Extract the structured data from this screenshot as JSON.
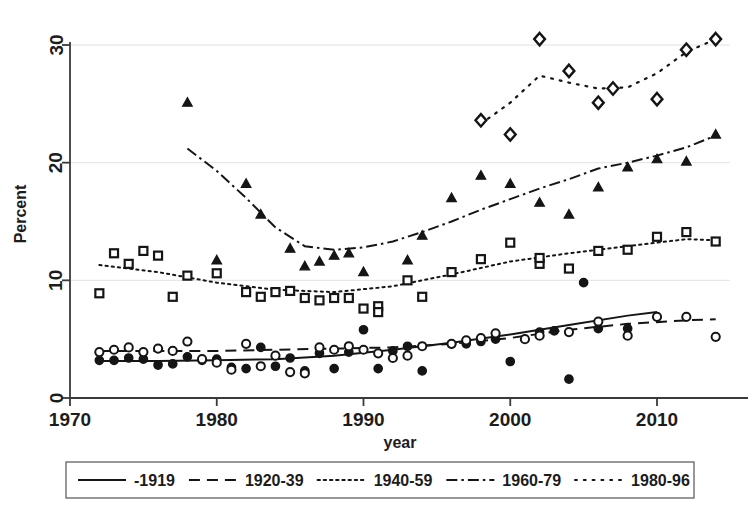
{
  "figure": {
    "width": 756,
    "height": 525,
    "background": "#ffffff",
    "ink_color": "#151515",
    "grid_color": "#e2e2e2",
    "clipped_top_caption": ""
  },
  "chart_data": {
    "type": "scatter",
    "title": "",
    "subtitle": "",
    "xlabel": "year",
    "ylabel": "Percent",
    "xlim": [
      1970,
      2015
    ],
    "ylim": [
      0,
      31.5
    ],
    "xticks": [
      1970,
      1980,
      1990,
      2000,
      2010
    ],
    "yticks": [
      0,
      10,
      20,
      30
    ],
    "xtick_labels": [
      "1970",
      "1980",
      "1990",
      "2000",
      "2010"
    ],
    "ytick_labels": [
      "0",
      "10",
      "20",
      "30"
    ],
    "grid": "horizontal",
    "legend_position": "below-axes",
    "legend_entries": [
      {
        "label": "-1919",
        "dash": "solid",
        "marker": "filled-circle"
      },
      {
        "label": "1920-39",
        "dash": "dashed",
        "marker": "open-circle"
      },
      {
        "label": "1940-59",
        "dash": "dotted",
        "marker": "open-square"
      },
      {
        "label": "1960-79",
        "dash": "dash-dot",
        "marker": "filled-triangle"
      },
      {
        "label": "1980-96",
        "dash": "sparse-dot",
        "marker": "open-diamond"
      }
    ],
    "series": [
      {
        "name": "-1919",
        "marker": "filled-circle",
        "dash": "solid",
        "points": [
          {
            "x": 1972,
            "y": 3.2
          },
          {
            "x": 1973,
            "y": 3.2
          },
          {
            "x": 1974,
            "y": 3.4
          },
          {
            "x": 1975,
            "y": 3.3
          },
          {
            "x": 1976,
            "y": 2.8
          },
          {
            "x": 1977,
            "y": 2.9
          },
          {
            "x": 1978,
            "y": 3.5
          },
          {
            "x": 1979,
            "y": 3.2
          },
          {
            "x": 1980,
            "y": 3.3
          },
          {
            "x": 1981,
            "y": 2.6
          },
          {
            "x": 1982,
            "y": 2.5
          },
          {
            "x": 1983,
            "y": 4.3
          },
          {
            "x": 1984,
            "y": 2.7
          },
          {
            "x": 1985,
            "y": 3.4
          },
          {
            "x": 1986,
            "y": 2.3
          },
          {
            "x": 1987,
            "y": 3.8
          },
          {
            "x": 1988,
            "y": 2.5
          },
          {
            "x": 1989,
            "y": 3.9
          },
          {
            "x": 1990,
            "y": 5.8
          },
          {
            "x": 1991,
            "y": 2.5
          },
          {
            "x": 1992,
            "y": 4.0
          },
          {
            "x": 1993,
            "y": 4.4
          },
          {
            "x": 1994,
            "y": 2.3
          },
          {
            "x": 1996,
            "y": 4.6
          },
          {
            "x": 1997,
            "y": 4.6
          },
          {
            "x": 1998,
            "y": 4.8
          },
          {
            "x": 1999,
            "y": 5.0
          },
          {
            "x": 2000,
            "y": 3.1
          },
          {
            "x": 2002,
            "y": 5.6
          },
          {
            "x": 2003,
            "y": 5.7
          },
          {
            "x": 2004,
            "y": 1.6
          },
          {
            "x": 2005,
            "y": 9.8
          },
          {
            "x": 2006,
            "y": 5.9
          },
          {
            "x": 2008,
            "y": 5.9
          }
        ],
        "trend": [
          {
            "x": 1972,
            "y": 3.15
          },
          {
            "x": 1976,
            "y": 3.15
          },
          {
            "x": 1980,
            "y": 3.2
          },
          {
            "x": 1984,
            "y": 3.3
          },
          {
            "x": 1988,
            "y": 3.6
          },
          {
            "x": 1992,
            "y": 4.1
          },
          {
            "x": 1996,
            "y": 4.7
          },
          {
            "x": 2000,
            "y": 5.4
          },
          {
            "x": 2004,
            "y": 6.2
          },
          {
            "x": 2008,
            "y": 7.0
          },
          {
            "x": 2010,
            "y": 7.3
          }
        ]
      },
      {
        "name": "1920-39",
        "marker": "open-circle",
        "dash": "dashed",
        "points": [
          {
            "x": 1972,
            "y": 3.9
          },
          {
            "x": 1973,
            "y": 4.1
          },
          {
            "x": 1974,
            "y": 4.3
          },
          {
            "x": 1975,
            "y": 3.9
          },
          {
            "x": 1976,
            "y": 4.2
          },
          {
            "x": 1977,
            "y": 4.0
          },
          {
            "x": 1978,
            "y": 4.8
          },
          {
            "x": 1979,
            "y": 3.3
          },
          {
            "x": 1980,
            "y": 3.0
          },
          {
            "x": 1981,
            "y": 2.4
          },
          {
            "x": 1982,
            "y": 4.6
          },
          {
            "x": 1983,
            "y": 2.7
          },
          {
            "x": 1984,
            "y": 3.6
          },
          {
            "x": 1985,
            "y": 2.2
          },
          {
            "x": 1986,
            "y": 2.1
          },
          {
            "x": 1987,
            "y": 4.3
          },
          {
            "x": 1988,
            "y": 4.1
          },
          {
            "x": 1989,
            "y": 4.4
          },
          {
            "x": 1990,
            "y": 4.1
          },
          {
            "x": 1991,
            "y": 3.8
          },
          {
            "x": 1992,
            "y": 3.4
          },
          {
            "x": 1993,
            "y": 3.6
          },
          {
            "x": 1994,
            "y": 4.4
          },
          {
            "x": 1996,
            "y": 4.6
          },
          {
            "x": 1997,
            "y": 4.9
          },
          {
            "x": 1998,
            "y": 5.1
          },
          {
            "x": 1999,
            "y": 5.5
          },
          {
            "x": 2001,
            "y": 5.0
          },
          {
            "x": 2002,
            "y": 5.3
          },
          {
            "x": 2004,
            "y": 5.6
          },
          {
            "x": 2006,
            "y": 6.5
          },
          {
            "x": 2008,
            "y": 5.3
          },
          {
            "x": 2010,
            "y": 6.9
          },
          {
            "x": 2012,
            "y": 6.9
          },
          {
            "x": 2014,
            "y": 5.2
          }
        ],
        "trend": [
          {
            "x": 1972,
            "y": 4.0
          },
          {
            "x": 1976,
            "y": 4.0
          },
          {
            "x": 1980,
            "y": 4.0
          },
          {
            "x": 1984,
            "y": 4.1
          },
          {
            "x": 1988,
            "y": 4.2
          },
          {
            "x": 1992,
            "y": 4.3
          },
          {
            "x": 1996,
            "y": 4.6
          },
          {
            "x": 2000,
            "y": 5.1
          },
          {
            "x": 2004,
            "y": 5.8
          },
          {
            "x": 2008,
            "y": 6.3
          },
          {
            "x": 2012,
            "y": 6.6
          },
          {
            "x": 2014,
            "y": 6.7
          }
        ]
      },
      {
        "name": "1940-59",
        "marker": "open-square",
        "dash": "dotted",
        "points": [
          {
            "x": 1972,
            "y": 8.9
          },
          {
            "x": 1973,
            "y": 12.3
          },
          {
            "x": 1974,
            "y": 11.4
          },
          {
            "x": 1975,
            "y": 12.5
          },
          {
            "x": 1976,
            "y": 12.1
          },
          {
            "x": 1977,
            "y": 8.6
          },
          {
            "x": 1978,
            "y": 10.4
          },
          {
            "x": 1980,
            "y": 10.6
          },
          {
            "x": 1982,
            "y": 9.0
          },
          {
            "x": 1983,
            "y": 8.6
          },
          {
            "x": 1984,
            "y": 9.0
          },
          {
            "x": 1985,
            "y": 9.1
          },
          {
            "x": 1986,
            "y": 8.5
          },
          {
            "x": 1987,
            "y": 8.3
          },
          {
            "x": 1988,
            "y": 8.5
          },
          {
            "x": 1989,
            "y": 8.5
          },
          {
            "x": 1990,
            "y": 7.6
          },
          {
            "x": 1991,
            "y": 7.8
          },
          {
            "x": 1991,
            "y": 7.3
          },
          {
            "x": 1993,
            "y": 10.0
          },
          {
            "x": 1994,
            "y": 8.6
          },
          {
            "x": 1996,
            "y": 10.7
          },
          {
            "x": 1998,
            "y": 11.8
          },
          {
            "x": 2000,
            "y": 13.2
          },
          {
            "x": 2002,
            "y": 11.4
          },
          {
            "x": 2002,
            "y": 11.9
          },
          {
            "x": 2004,
            "y": 11.0
          },
          {
            "x": 2006,
            "y": 12.5
          },
          {
            "x": 2008,
            "y": 12.6
          },
          {
            "x": 2010,
            "y": 13.7
          },
          {
            "x": 2012,
            "y": 14.1
          },
          {
            "x": 2014,
            "y": 13.3
          }
        ],
        "trend": [
          {
            "x": 1972,
            "y": 11.3
          },
          {
            "x": 1976,
            "y": 10.7
          },
          {
            "x": 1980,
            "y": 9.8
          },
          {
            "x": 1984,
            "y": 9.2
          },
          {
            "x": 1988,
            "y": 9.0
          },
          {
            "x": 1992,
            "y": 9.5
          },
          {
            "x": 1996,
            "y": 10.5
          },
          {
            "x": 2000,
            "y": 11.6
          },
          {
            "x": 2004,
            "y": 12.3
          },
          {
            "x": 2008,
            "y": 12.9
          },
          {
            "x": 2012,
            "y": 13.5
          },
          {
            "x": 2014,
            "y": 13.4
          }
        ]
      },
      {
        "name": "1960-79",
        "marker": "filled-triangle",
        "dash": "dash-dot",
        "points": [
          {
            "x": 1978,
            "y": 25.1
          },
          {
            "x": 1980,
            "y": 11.7
          },
          {
            "x": 1982,
            "y": 18.2
          },
          {
            "x": 1983,
            "y": 15.6
          },
          {
            "x": 1985,
            "y": 12.7
          },
          {
            "x": 1986,
            "y": 11.2
          },
          {
            "x": 1987,
            "y": 11.6
          },
          {
            "x": 1988,
            "y": 12.1
          },
          {
            "x": 1989,
            "y": 12.3
          },
          {
            "x": 1990,
            "y": 10.7
          },
          {
            "x": 1993,
            "y": 11.7
          },
          {
            "x": 1994,
            "y": 13.8
          },
          {
            "x": 1996,
            "y": 17.0
          },
          {
            "x": 1998,
            "y": 18.9
          },
          {
            "x": 2000,
            "y": 18.2
          },
          {
            "x": 2002,
            "y": 16.6
          },
          {
            "x": 2004,
            "y": 15.6
          },
          {
            "x": 2006,
            "y": 17.9
          },
          {
            "x": 2008,
            "y": 19.6
          },
          {
            "x": 2010,
            "y": 20.3
          },
          {
            "x": 2012,
            "y": 20.1
          },
          {
            "x": 2014,
            "y": 22.4
          }
        ],
        "trend": [
          {
            "x": 1978,
            "y": 21.2
          },
          {
            "x": 1980,
            "y": 19.3
          },
          {
            "x": 1982,
            "y": 17.0
          },
          {
            "x": 1984,
            "y": 14.5
          },
          {
            "x": 1986,
            "y": 12.9
          },
          {
            "x": 1988,
            "y": 12.6
          },
          {
            "x": 1990,
            "y": 12.8
          },
          {
            "x": 1992,
            "y": 13.3
          },
          {
            "x": 1994,
            "y": 14.1
          },
          {
            "x": 1996,
            "y": 15.0
          },
          {
            "x": 1998,
            "y": 16.0
          },
          {
            "x": 2000,
            "y": 16.9
          },
          {
            "x": 2002,
            "y": 17.8
          },
          {
            "x": 2004,
            "y": 18.6
          },
          {
            "x": 2006,
            "y": 19.5
          },
          {
            "x": 2008,
            "y": 20.0
          },
          {
            "x": 2010,
            "y": 20.6
          },
          {
            "x": 2012,
            "y": 21.3
          },
          {
            "x": 2014,
            "y": 22.3
          }
        ]
      },
      {
        "name": "1980-96",
        "marker": "open-diamond",
        "dash": "sparse-dot",
        "points": [
          {
            "x": 1998,
            "y": 23.6
          },
          {
            "x": 2000,
            "y": 22.4
          },
          {
            "x": 2002,
            "y": 30.5
          },
          {
            "x": 2004,
            "y": 27.8
          },
          {
            "x": 2006,
            "y": 25.1
          },
          {
            "x": 2007,
            "y": 26.3
          },
          {
            "x": 2010,
            "y": 25.4
          },
          {
            "x": 2012,
            "y": 29.6
          },
          {
            "x": 2014,
            "y": 30.5
          }
        ],
        "trend": [
          {
            "x": 1998,
            "y": 23.3
          },
          {
            "x": 2000,
            "y": 25.1
          },
          {
            "x": 2002,
            "y": 27.4
          },
          {
            "x": 2004,
            "y": 26.8
          },
          {
            "x": 2006,
            "y": 26.3
          },
          {
            "x": 2008,
            "y": 26.4
          },
          {
            "x": 2010,
            "y": 27.6
          },
          {
            "x": 2012,
            "y": 29.4
          },
          {
            "x": 2014,
            "y": 30.5
          }
        ]
      }
    ]
  }
}
